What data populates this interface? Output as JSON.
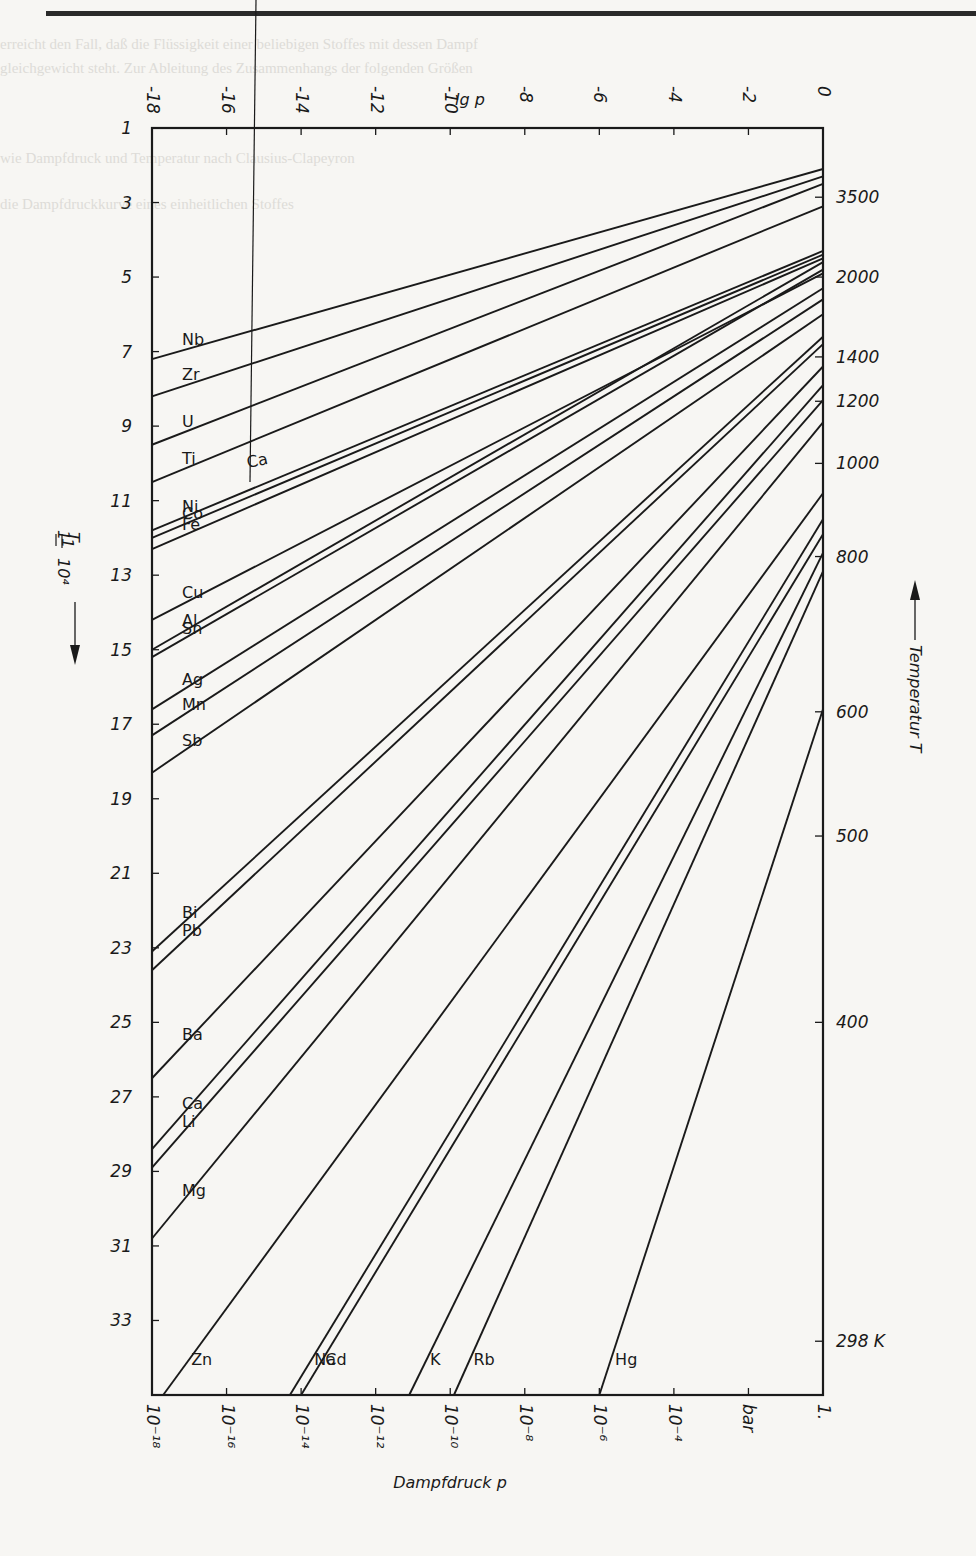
{
  "page": {
    "background": "#f7f6f3",
    "ink": "#1a1a1a",
    "faint_text_lines": [
      "erreicht den Fall, daß die Flüssigkeit einer beliebigen Stoffes mit dessen Dampf",
      "gleichgewicht steht. Zur Ableitung des Zusammenhangs der folgenden Größen",
      "wie Dampfdruck und Temperatur nach Clausius-Clapeyron",
      "die Dampfdruckkurve eines einheitlichen Stoffes"
    ]
  },
  "chart_data": {
    "type": "line",
    "title": "",
    "top_axis": {
      "label": "lg p",
      "ticks": [
        "-18",
        "-16",
        "-14",
        "-12",
        "-10",
        "-8",
        "-6",
        "-4",
        "-2",
        "0"
      ],
      "values": [
        -18,
        -16,
        -14,
        -12,
        -10,
        -8,
        -6,
        -4,
        -2,
        0
      ]
    },
    "bottom_axis": {
      "label": "Dampfdruck  p",
      "ticks": [
        "10⁻¹⁸",
        "10⁻¹⁶",
        "10⁻¹⁴",
        "10⁻¹²",
        "10⁻¹⁰",
        "10⁻⁸",
        "10⁻⁶",
        "10⁻⁴",
        "bar",
        "1."
      ],
      "unit": "bar"
    },
    "left_axis": {
      "label": "1/T · 10⁴",
      "arrow": "down",
      "ticks": [
        "1",
        "3",
        "5",
        "7",
        "9",
        "11",
        "13",
        "15",
        "17",
        "19",
        "21",
        "23",
        "25",
        "27",
        "29",
        "31",
        "33"
      ],
      "values": [
        1,
        3,
        5,
        7,
        9,
        11,
        13,
        15,
        17,
        19,
        21,
        23,
        25,
        27,
        29,
        31,
        33
      ],
      "range": [
        1,
        35
      ]
    },
    "right_axis": {
      "label": "Temperatur  T",
      "arrow": "up",
      "ticks": [
        "3500",
        "2000",
        "1400",
        "1200",
        "1000",
        "800",
        "600",
        "500",
        "400",
        "298 K"
      ],
      "values_K": [
        3500,
        2000,
        1400,
        1200,
        1000,
        800,
        600,
        500,
        400,
        298
      ]
    },
    "xlim": [
      -18,
      0
    ],
    "ylim": [
      1,
      35
    ],
    "grid": false,
    "series": [
      {
        "name": "Nb",
        "lgp_start": -18,
        "invT_start": 7.2,
        "lgp_end": 0,
        "invT_end": 2.1
      },
      {
        "name": "Zr",
        "lgp_start": -18,
        "invT_start": 8.2,
        "lgp_end": 0,
        "invT_end": 2.3
      },
      {
        "name": "U",
        "lgp_start": -18,
        "invT_start": 9.5,
        "lgp_end": 0,
        "invT_end": 2.5
      },
      {
        "name": "Ti",
        "lgp_start": -18,
        "invT_start": 10.5,
        "lgp_end": 0,
        "invT_end": 3.1
      },
      {
        "name": "Ni",
        "lgp_start": -18,
        "invT_start": 11.8,
        "lgp_end": 0,
        "invT_end": 4.3
      },
      {
        "name": "Co",
        "lgp_start": -18,
        "invT_start": 12.0,
        "lgp_end": 0,
        "invT_end": 4.4
      },
      {
        "name": "Fe",
        "lgp_start": -18,
        "invT_start": 12.3,
        "lgp_end": 0,
        "invT_end": 4.5
      },
      {
        "name": "Cu",
        "lgp_start": -18,
        "invT_start": 14.2,
        "lgp_end": 0,
        "invT_end": 4.9
      },
      {
        "name": "Al",
        "lgp_start": -18,
        "invT_start": 15.0,
        "lgp_end": 0,
        "invT_end": 4.6
      },
      {
        "name": "Sn",
        "lgp_start": -18,
        "invT_start": 15.2,
        "lgp_end": 0,
        "invT_end": 4.8
      },
      {
        "name": "Ag",
        "lgp_start": -18,
        "invT_start": 16.6,
        "lgp_end": 0,
        "invT_end": 5.3
      },
      {
        "name": "Mn",
        "lgp_start": -18,
        "invT_start": 17.3,
        "lgp_end": 0,
        "invT_end": 5.6
      },
      {
        "name": "Sb",
        "lgp_start": -18,
        "invT_start": 18.3,
        "lgp_end": 0,
        "invT_end": 6.0
      },
      {
        "name": "Bi",
        "lgp_start": -18,
        "invT_start": 23.1,
        "lgp_end": 0,
        "invT_end": 6.6
      },
      {
        "name": "Pb",
        "lgp_start": -18,
        "invT_start": 23.6,
        "lgp_end": 0,
        "invT_end": 6.8
      },
      {
        "name": "Ba",
        "lgp_start": -18,
        "invT_start": 26.5,
        "lgp_end": 0,
        "invT_end": 7.4
      },
      {
        "name": "Ca",
        "lgp_start": -18,
        "invT_start": 28.4,
        "lgp_end": 0,
        "invT_end": 7.9
      },
      {
        "name": "Li",
        "lgp_start": -18,
        "invT_start": 28.9,
        "lgp_end": 0,
        "invT_end": 8.3
      },
      {
        "name": "Mg",
        "lgp_start": -18,
        "invT_start": 30.8,
        "lgp_end": 0,
        "invT_end": 8.9
      },
      {
        "name": "Zn",
        "lgp_start": -17.7,
        "invT_start": 35,
        "lgp_end": 0,
        "invT_end": 10.8
      },
      {
        "name": "Na",
        "lgp_start": -14.3,
        "invT_start": 35,
        "lgp_end": 0,
        "invT_end": 11.5
      },
      {
        "name": "Cd",
        "lgp_start": -14.0,
        "invT_start": 35,
        "lgp_end": 0,
        "invT_end": 11.9
      },
      {
        "name": "K",
        "lgp_start": -11.1,
        "invT_start": 35,
        "lgp_end": 0,
        "invT_end": 12.4
      },
      {
        "name": "Rb",
        "lgp_start": -9.9,
        "invT_start": 35,
        "lgp_end": 0,
        "invT_end": 12.9
      },
      {
        "name": "Hg",
        "lgp_start": -6.0,
        "invT_start": 35,
        "lgp_end": 0,
        "invT_end": 16.6
      }
    ],
    "annotations": [
      "Ca (pointer to upper curve near Ni)"
    ]
  },
  "labels": {
    "top_axis_title": "lg p",
    "bottom_axis_title": "Dampfdruck  p",
    "left_axis_title_num": "1",
    "left_axis_title_den": "T",
    "left_axis_title_factor": "10⁴",
    "right_axis_title": "Temperatur  T",
    "ca_upper": "Ca"
  }
}
